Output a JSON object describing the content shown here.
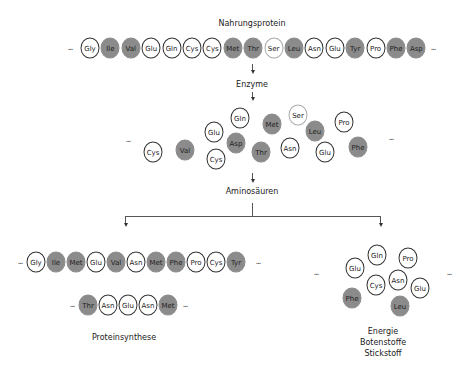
{
  "labels": {
    "source": "Nahrungsprotein",
    "step1": "Enzyme",
    "step2": "Aminosäuren",
    "left_result": "Proteinsynthese",
    "right_result_1": "Energie",
    "right_result_2": "Botenstoffe",
    "right_result_3": "Stickstoff",
    "ellipsis": "..."
  },
  "colors": {
    "dark_fill": "#8b8b8b",
    "outline": "#333333"
  },
  "protein_chain": [
    {
      "name": "Gly",
      "dark": false
    },
    {
      "name": "Ile",
      "dark": true
    },
    {
      "name": "Val",
      "dark": true
    },
    {
      "name": "Glu",
      "dark": false
    },
    {
      "name": "Gln",
      "dark": false
    },
    {
      "name": "Cys",
      "dark": false
    },
    {
      "name": "Cys",
      "dark": false
    },
    {
      "name": "Met",
      "dark": true
    },
    {
      "name": "Thr",
      "dark": true
    },
    {
      "name": "Ser",
      "dark": false,
      "light": true
    },
    {
      "name": "Leu",
      "dark": true
    },
    {
      "name": "Asn",
      "dark": false
    },
    {
      "name": "Glu",
      "dark": false
    },
    {
      "name": "Tyr",
      "dark": true
    },
    {
      "name": "Pro",
      "dark": false
    },
    {
      "name": "Phe",
      "dark": true
    },
    {
      "name": "Asp",
      "dark": true
    }
  ],
  "free_amino_acids": [
    {
      "name": "Cys",
      "dark": false,
      "x": 153,
      "y": 152
    },
    {
      "name": "Val",
      "dark": true,
      "x": 185,
      "y": 150
    },
    {
      "name": "Glu",
      "dark": false,
      "x": 214,
      "y": 132
    },
    {
      "name": "Cys",
      "dark": false,
      "x": 216,
      "y": 159
    },
    {
      "name": "Gln",
      "dark": false,
      "x": 240,
      "y": 118
    },
    {
      "name": "Asp",
      "dark": true,
      "x": 236,
      "y": 143
    },
    {
      "name": "Met",
      "dark": true,
      "x": 272,
      "y": 124
    },
    {
      "name": "Thr",
      "dark": true,
      "x": 261,
      "y": 152
    },
    {
      "name": "Ser",
      "dark": false,
      "light": true,
      "x": 298,
      "y": 115
    },
    {
      "name": "Asn",
      "dark": false,
      "x": 290,
      "y": 148
    },
    {
      "name": "Leu",
      "dark": true,
      "x": 315,
      "y": 131
    },
    {
      "name": "Glu",
      "dark": false,
      "x": 325,
      "y": 152
    },
    {
      "name": "Pro",
      "dark": false,
      "x": 344,
      "y": 122
    },
    {
      "name": "Phe",
      "dark": true,
      "x": 358,
      "y": 147
    }
  ],
  "synthesis_chain_1": [
    {
      "name": "Gly",
      "dark": false
    },
    {
      "name": "Ile",
      "dark": true
    },
    {
      "name": "Met",
      "dark": true
    },
    {
      "name": "Glu",
      "dark": false
    },
    {
      "name": "Val",
      "dark": true
    },
    {
      "name": "Asn",
      "dark": false
    },
    {
      "name": "Met",
      "dark": true
    },
    {
      "name": "Phe",
      "dark": true
    },
    {
      "name": "Pro",
      "dark": false
    },
    {
      "name": "Cys",
      "dark": false
    },
    {
      "name": "Tyr",
      "dark": true
    }
  ],
  "synthesis_chain_2": [
    {
      "name": "Thr",
      "dark": true
    },
    {
      "name": "Asn",
      "dark": false
    },
    {
      "name": "Glu",
      "dark": false
    },
    {
      "name": "Asn",
      "dark": false
    },
    {
      "name": "Met",
      "dark": true
    }
  ],
  "catabolism_cluster": [
    {
      "name": "Gln",
      "dark": false,
      "x": 377,
      "y": 255
    },
    {
      "name": "Pro",
      "dark": false,
      "x": 408,
      "y": 258
    },
    {
      "name": "Glu",
      "dark": false,
      "x": 355,
      "y": 268
    },
    {
      "name": "Cys",
      "dark": false,
      "x": 376,
      "y": 285
    },
    {
      "name": "Asn",
      "dark": false,
      "x": 398,
      "y": 280
    },
    {
      "name": "Glu",
      "dark": false,
      "x": 420,
      "y": 288
    },
    {
      "name": "Phe",
      "dark": true,
      "x": 352,
      "y": 298
    },
    {
      "name": "Leu",
      "dark": true,
      "x": 400,
      "y": 306
    }
  ]
}
